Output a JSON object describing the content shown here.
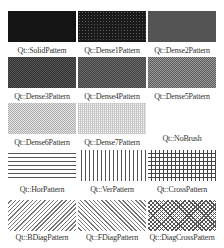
{
  "patterns": [
    {
      "label": "Qt::SolidPattern",
      "style": "solid"
    },
    {
      "label": "Qt::Dense1Pattern",
      "style": "dense1"
    },
    {
      "label": "Qt::Dense2Pattern",
      "style": "dense2"
    },
    {
      "label": "Qt::Dense3Pattern",
      "style": "dense3"
    },
    {
      "label": "Qt::Dense4Pattern",
      "style": "dense4"
    },
    {
      "label": "Qt::Dense5Pattern",
      "style": "dense5"
    },
    {
      "label": "Qt::Dense6Pattern",
      "style": "dense6"
    },
    {
      "label": "Qt::Dense7Pattern",
      "style": "dense7"
    },
    {
      "label": "Qt::NoBrush",
      "style": "nobrush"
    },
    {
      "label": "Qt::HorPattern",
      "style": "hor"
    },
    {
      "label": "Qt::VerPattern",
      "style": "ver"
    },
    {
      "label": "Qt::CrossPattern",
      "style": "cross"
    },
    {
      "label": "Qt::BDiagPattern",
      "style": "bdiag"
    },
    {
      "label": "Qt::FDiagPattern",
      "style": "fdiag"
    },
    {
      "label": "Qt::DiagCrossPattern",
      "style": "diagcross"
    }
  ]
}
